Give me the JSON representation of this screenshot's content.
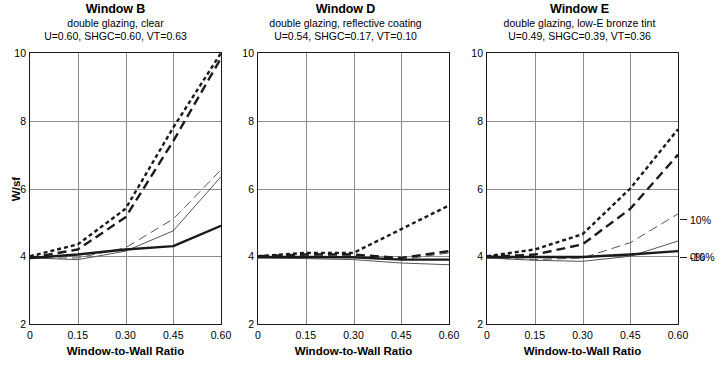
{
  "figure": {
    "axis_y_title": "W/sf",
    "axis_x_title": "Window-to-Wall Ratio",
    "y_ticks": [
      "10",
      "8",
      "6",
      "4",
      "2"
    ],
    "x_ticks": [
      "0",
      "0.15",
      "0.30",
      "0.45",
      "0.60"
    ],
    "legend": [
      {
        "label": "10%"
      },
      {
        "label": "0%"
      },
      {
        "label": "-10%"
      }
    ]
  },
  "panels": [
    {
      "title": "Window B",
      "subtitle_1": "double glazing, clear",
      "subtitle_2": "U=0.60, SHGC=0.60, VT=0.63"
    },
    {
      "title": "Window D",
      "subtitle_1": "double glazing, reflective coating",
      "subtitle_2": "U=0.54, SHGC=0.17, VT=0.10"
    },
    {
      "title": "Window E",
      "subtitle_1": "double glazing, low-E bronze tint",
      "subtitle_2": "U=0.49, SHGC=0.39, VT=0.36"
    }
  ],
  "chart_data": {
    "type": "line",
    "xlabel": "Window-to-Wall Ratio",
    "ylabel": "W/sf",
    "xlim": [
      0,
      0.6
    ],
    "ylim": [
      2,
      10
    ],
    "x": [
      0,
      0.15,
      0.3,
      0.45,
      0.6
    ],
    "grid": true,
    "legend_position": "right-of-last-panel",
    "legend_entries": [
      "10%",
      "0%",
      "-10%"
    ],
    "panels": [
      {
        "name": "Window B",
        "subtitle": "double glazing, clear",
        "U": 0.6,
        "SHGC": 0.6,
        "VT": 0.63,
        "series": [
          {
            "name": "10% short-dash",
            "style": "short-dash",
            "width": "thick",
            "color": "#1a1a1a",
            "values": [
              4.0,
              4.35,
              5.4,
              7.8,
              10.0
            ]
          },
          {
            "name": "10% long-dash",
            "style": "long-dash",
            "width": "thick",
            "color": "#1a1a1a",
            "values": [
              3.95,
              4.2,
              5.15,
              7.4,
              9.85
            ]
          },
          {
            "name": "0% long-dash thin",
            "style": "long-dash",
            "width": "thin",
            "color": "#555555",
            "values": [
              3.95,
              3.95,
              4.25,
              5.1,
              6.55
            ]
          },
          {
            "name": "-10% solid thin",
            "style": "solid",
            "width": "thin",
            "color": "#555555",
            "values": [
              3.95,
              3.9,
              4.15,
              4.75,
              6.35
            ]
          },
          {
            "name": "0% solid thick",
            "style": "solid",
            "width": "thick",
            "color": "#1a1a1a",
            "values": [
              3.95,
              4.05,
              4.2,
              4.3,
              4.9
            ]
          }
        ]
      },
      {
        "name": "Window D",
        "subtitle": "double glazing, reflective coating",
        "U": 0.54,
        "SHGC": 0.17,
        "VT": 0.1,
        "series": [
          {
            "name": "10% short-dash",
            "style": "short-dash",
            "width": "thick",
            "color": "#1a1a1a",
            "values": [
              4.0,
              4.1,
              4.1,
              4.8,
              5.5
            ]
          },
          {
            "name": "10% long-dash",
            "style": "long-dash",
            "width": "thick",
            "color": "#1a1a1a",
            "values": [
              4.0,
              4.05,
              4.05,
              3.95,
              4.15
            ]
          },
          {
            "name": "0% long-dash thin",
            "style": "long-dash",
            "width": "thin",
            "color": "#555555",
            "values": [
              3.98,
              3.98,
              3.98,
              3.9,
              4.1
            ]
          },
          {
            "name": "-10% solid thin",
            "style": "solid",
            "width": "thin",
            "color": "#555555",
            "values": [
              3.95,
              3.93,
              3.9,
              3.8,
              3.75
            ]
          },
          {
            "name": "0% solid thick",
            "style": "solid",
            "width": "thick",
            "color": "#1a1a1a",
            "values": [
              3.98,
              3.98,
              3.97,
              3.9,
              3.9
            ]
          }
        ]
      },
      {
        "name": "Window E",
        "subtitle": "double glazing, low-E bronze tint",
        "U": 0.49,
        "SHGC": 0.39,
        "VT": 0.36,
        "series": [
          {
            "name": "10% short-dash",
            "style": "short-dash",
            "width": "thick",
            "color": "#1a1a1a",
            "values": [
              4.0,
              4.2,
              4.65,
              6.0,
              7.75
            ]
          },
          {
            "name": "10% long-dash",
            "style": "long-dash",
            "width": "thick",
            "color": "#1a1a1a",
            "values": [
              3.98,
              4.05,
              4.35,
              5.4,
              7.0
            ]
          },
          {
            "name": "0% long-dash thin",
            "style": "long-dash",
            "width": "thin",
            "color": "#555555",
            "values": [
              3.95,
              3.9,
              3.95,
              4.4,
              5.25
            ]
          },
          {
            "name": "-10% solid thin",
            "style": "solid",
            "width": "thin",
            "color": "#555555",
            "values": [
              3.95,
              3.88,
              3.85,
              4.0,
              4.45
            ]
          },
          {
            "name": "0% solid thick",
            "style": "solid",
            "width": "thick",
            "color": "#1a1a1a",
            "values": [
              3.98,
              3.98,
              3.98,
              4.05,
              4.15
            ]
          }
        ]
      }
    ]
  }
}
